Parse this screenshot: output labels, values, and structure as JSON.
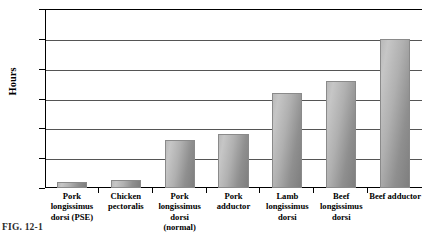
{
  "chart_data": {
    "type": "bar",
    "title": "",
    "xlabel": "",
    "ylabel": "Hours",
    "ylim": [
      0,
      30
    ],
    "yticks": [
      0,
      5,
      10,
      15,
      20,
      25,
      30
    ],
    "grid": true,
    "legend": "none",
    "categories": [
      "Pork longissimus dorsi (PSE)",
      "Chicken pectoralis",
      "Pork longissimus dorsi (normal)",
      "Pork adductor",
      "Lamb longissimus dorsi",
      "Beef longissimus dorsi",
      "Beef adductor"
    ],
    "values": [
      1,
      1.4,
      8,
      9,
      16,
      18,
      25
    ],
    "bar_color": "#b0b0b0"
  },
  "axis": {
    "y_title": "Hours",
    "y_tick_labels": [
      "30",
      "25",
      "20",
      "15",
      "10",
      "5",
      "0"
    ]
  },
  "x_axis": {
    "labels": [
      "Pork longissimus dorsi (PSE)",
      "Chicken pectoralis",
      "Pork longissimus dorsi (normal)",
      "Pork adductor",
      "Lamb longissimus dorsi",
      "Beef longissimus dorsi",
      "Beef adductor"
    ]
  },
  "caption": {
    "text": "FIG. 12-1"
  }
}
